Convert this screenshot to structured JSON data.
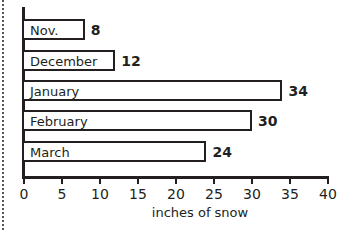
{
  "chart_data": {
    "type": "bar",
    "orientation": "horizontal",
    "title": "",
    "categories": [
      "Nov.",
      "December",
      "January",
      "February",
      "March"
    ],
    "values": [
      8,
      12,
      34,
      30,
      24
    ],
    "xlabel": "inches of snow",
    "ylabel": "",
    "xlim": [
      0,
      40
    ],
    "xticks": [
      "0",
      "5",
      "10",
      "15",
      "20",
      "25",
      "30",
      "35",
      "40"
    ],
    "value_labels": [
      "8",
      "12",
      "34",
      "30",
      "24"
    ],
    "grid": false,
    "legend": null,
    "bar_color": "#ffffff",
    "bar_outline": "#231f20"
  }
}
